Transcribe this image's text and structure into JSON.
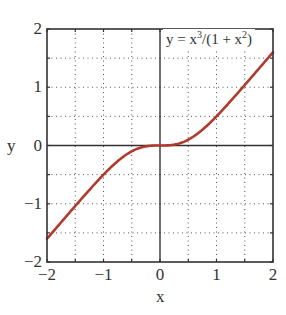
{
  "chart_data": {
    "type": "line",
    "title": "",
    "xlabel": "x",
    "ylabel": "y",
    "xlim": [
      -2,
      2
    ],
    "ylim": [
      -2,
      2
    ],
    "grid": true,
    "grid_style": "dotted",
    "x_ticks": [
      -2,
      -1,
      0,
      1,
      2
    ],
    "x_tick_labels": [
      "−2",
      "−1",
      "0",
      "1",
      "2"
    ],
    "y_ticks": [
      -2,
      -1,
      0,
      1,
      2
    ],
    "y_tick_labels": [
      "−2",
      "−1",
      "0",
      "1",
      "2"
    ],
    "minor_grid_step": 0.5,
    "annotation": "y = x³/(1 + x²)",
    "legend_position": "top-right",
    "series": [
      {
        "name": "y = x^3/(1 + x^2)",
        "color": "#b03a2e",
        "x": [
          -2.0,
          -1.75,
          -1.5,
          -1.25,
          -1.0,
          -0.75,
          -0.5,
          -0.25,
          0.0,
          0.25,
          0.5,
          0.75,
          1.0,
          1.25,
          1.5,
          1.75,
          2.0
        ],
        "y": [
          -1.6,
          -1.32,
          -1.04,
          -0.76,
          -0.5,
          -0.27,
          -0.1,
          -0.015,
          0.0,
          0.015,
          0.1,
          0.27,
          0.5,
          0.76,
          1.04,
          1.32,
          1.6
        ]
      }
    ]
  },
  "labels": {
    "legend_prefix": "y = x",
    "legend_sup1": "3",
    "legend_mid": "/(1 + x",
    "legend_sup2": "2",
    "legend_suffix": ")",
    "xlabel": "x",
    "ylabel": "y"
  },
  "colors": {
    "curve": "#b03a2e",
    "axis": "#333333",
    "grid": "#555555"
  }
}
